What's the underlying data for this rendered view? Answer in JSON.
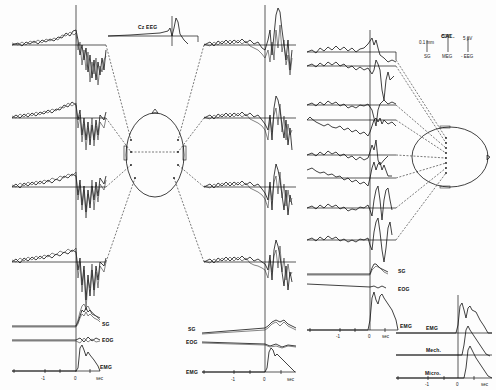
{
  "figure": {
    "panels": [
      {
        "id": "left",
        "inset_label": "Cz EEG",
        "channel_labels": [
          "SG",
          "EOG",
          "EMG"
        ],
        "x_ticks": [
          "-1",
          "0",
          "sec"
        ]
      },
      {
        "id": "middle",
        "channel_labels": [
          "SG",
          "EOG",
          "EMG"
        ],
        "x_ticks": [
          "-1",
          "0",
          "sec"
        ]
      },
      {
        "id": "right",
        "channel_labels": [
          "SG",
          "EOG",
          "EMG"
        ],
        "x_ticks": [
          "-1",
          "0",
          "sec"
        ]
      },
      {
        "id": "inset-bottom-right",
        "channel_labels": [
          "EMG",
          "Mech.",
          "Micro."
        ],
        "x_ticks": [
          "-1",
          "0",
          "sec"
        ]
      }
    ],
    "calibration": {
      "title": "CAL.",
      "items": [
        {
          "value": "0.1 mm",
          "label": "SG"
        },
        {
          "value": "50 fT",
          "label": "MEG"
        },
        {
          "value": "5 µV",
          "label": "- EEG"
        }
      ]
    },
    "head_diagrams": [
      {
        "id": "top-view",
        "electrodes": 8
      },
      {
        "id": "side-view",
        "electrodes": 9
      }
    ]
  }
}
